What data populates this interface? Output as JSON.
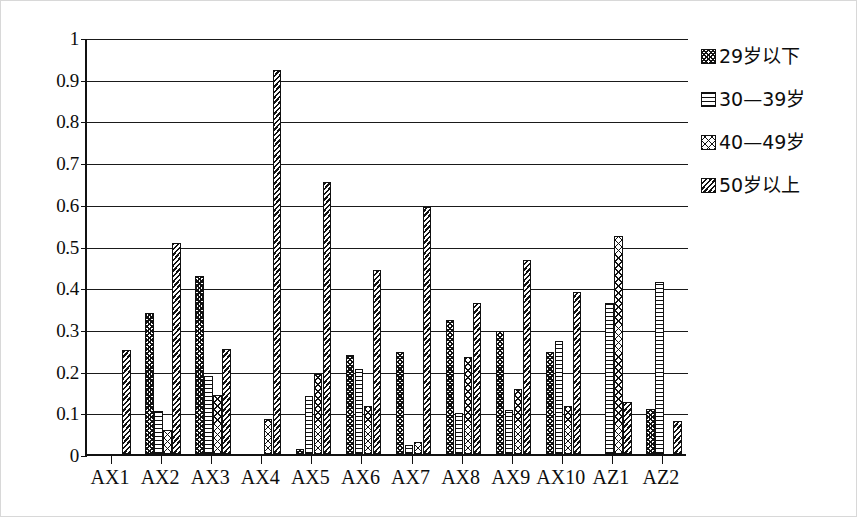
{
  "chart_data": {
    "type": "bar",
    "title": "",
    "subtitle": "",
    "xlabel": "",
    "ylabel": "",
    "ylim": [
      0,
      1
    ],
    "ytick_labels": [
      "1",
      "0.9",
      "0.8",
      "0.7",
      "0.6",
      "0.5",
      "0.4",
      "0.3",
      "0.2",
      "0.1",
      "0"
    ],
    "ytick_values": [
      1,
      0.9,
      0.8,
      0.7,
      0.6,
      0.5,
      0.4,
      0.3,
      0.2,
      0.1,
      0
    ],
    "grid": true,
    "legend_position": "right",
    "categories": [
      "AX1",
      "AX2",
      "AX3",
      "AX4",
      "AX5",
      "AX6",
      "AX7",
      "AX8",
      "AX9",
      "AX10",
      "AZ1",
      "AZ2"
    ],
    "series": [
      {
        "name": "29岁以下",
        "pattern": "checker",
        "values": [
          0,
          0.338,
          0.428,
          0,
          0.012,
          0.238,
          0.245,
          0.322,
          0.295,
          0.245,
          0,
          0.108
        ]
      },
      {
        "name": "30—39岁",
        "pattern": "horizontal-lines",
        "values": [
          0,
          0.102,
          0.188,
          0,
          0.138,
          0.205,
          0.022,
          0.098,
          0.105,
          0.272,
          0.363,
          0.413
        ]
      },
      {
        "name": "40—49岁",
        "pattern": "open-crosshatch",
        "values": [
          0,
          0.058,
          0.142,
          0.085,
          0.192,
          0.115,
          0.028,
          0.232,
          0.157,
          0.115,
          0.522,
          0
        ]
      },
      {
        "name": "50岁以上",
        "pattern": "diagonal-hatch",
        "values": [
          0.25,
          0.505,
          0.252,
          0.922,
          0.652,
          0.442,
          0.593,
          0.363,
          0.465,
          0.388,
          0.125,
          0.08
        ]
      }
    ]
  },
  "legend": {
    "items": [
      {
        "label": "29岁以下"
      },
      {
        "label": "30—39岁"
      },
      {
        "label": "40—49岁"
      },
      {
        "label": "50岁以上"
      }
    ]
  }
}
